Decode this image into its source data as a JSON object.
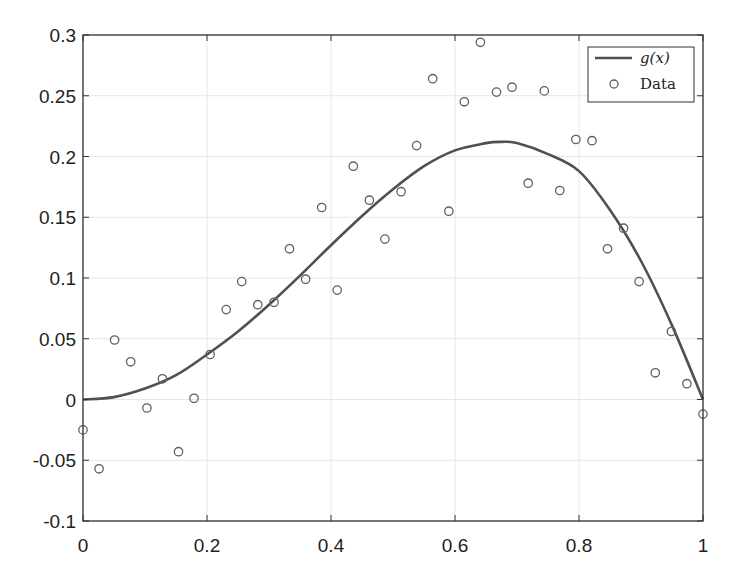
{
  "chart_data": {
    "type": "scatter",
    "title": "",
    "xlabel": "",
    "ylabel": "",
    "xlim": [
      0,
      1
    ],
    "ylim": [
      -0.1,
      0.3
    ],
    "grid": true,
    "legend_position": "upper right",
    "x_ticks": [
      0,
      0.2,
      0.4,
      0.6,
      0.8,
      1
    ],
    "x_tick_labels": [
      "0",
      "0.2",
      "0.4",
      "0.6",
      "0.8",
      "1"
    ],
    "y_ticks": [
      -0.1,
      -0.05,
      0,
      0.05,
      0.1,
      0.15,
      0.2,
      0.25,
      0.3
    ],
    "y_tick_labels": [
      "-0.1",
      "-0.05",
      "0",
      "0.05",
      "0.1",
      "0.15",
      "0.2",
      "0.25",
      "0.3"
    ],
    "series": [
      {
        "name": "g(x)",
        "type": "line",
        "color": "#505050",
        "x": [
          0,
          0.05,
          0.1,
          0.15,
          0.2,
          0.25,
          0.3,
          0.35,
          0.4,
          0.45,
          0.5,
          0.55,
          0.6,
          0.65,
          0.675,
          0.7,
          0.75,
          0.8,
          0.85,
          0.9,
          0.95,
          1.0
        ],
        "values": [
          0,
          0.002,
          0.009,
          0.02,
          0.037,
          0.056,
          0.078,
          0.102,
          0.127,
          0.151,
          0.173,
          0.192,
          0.205,
          0.211,
          0.212,
          0.211,
          0.202,
          0.188,
          0.156,
          0.114,
          0.061,
          0
        ]
      },
      {
        "name": "Data",
        "type": "scatter",
        "marker": "circle-open",
        "color": "#606060",
        "x": [
          0.0,
          0.026,
          0.051,
          0.077,
          0.103,
          0.128,
          0.154,
          0.179,
          0.205,
          0.231,
          0.256,
          0.282,
          0.308,
          0.333,
          0.359,
          0.385,
          0.41,
          0.436,
          0.462,
          0.487,
          0.513,
          0.538,
          0.564,
          0.59,
          0.615,
          0.641,
          0.667,
          0.692,
          0.718,
          0.744,
          0.769,
          0.795,
          0.821,
          0.846,
          0.872,
          0.897,
          0.923,
          0.949,
          0.974,
          1.0
        ],
        "values": [
          -0.025,
          -0.057,
          0.049,
          0.031,
          -0.007,
          0.017,
          -0.043,
          0.001,
          0.037,
          0.074,
          0.097,
          0.078,
          0.08,
          0.124,
          0.099,
          0.158,
          0.09,
          0.192,
          0.164,
          0.132,
          0.171,
          0.209,
          0.264,
          0.155,
          0.245,
          0.294,
          0.253,
          0.257,
          0.178,
          0.254,
          0.172,
          0.214,
          0.213,
          0.124,
          0.141,
          0.097,
          0.022,
          0.056,
          0.013,
          -0.012
        ]
      }
    ]
  },
  "legend": {
    "items": [
      {
        "label": "g(x)",
        "kind": "line"
      },
      {
        "label": "Data",
        "kind": "marker"
      }
    ]
  }
}
